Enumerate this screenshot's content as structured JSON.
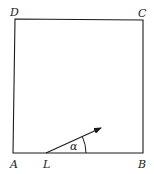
{
  "diagram": {
    "type": "square-with-vector",
    "vertices": {
      "A": {
        "label": "A",
        "x": 13,
        "y": 153
      },
      "B": {
        "label": "B",
        "x": 143,
        "y": 153
      },
      "C": {
        "label": "C",
        "x": 143,
        "y": 20
      },
      "D": {
        "label": "D",
        "x": 15,
        "y": 19
      }
    },
    "point_L": {
      "label": "L",
      "x": 46,
      "y": 153
    },
    "arrow": {
      "from": "L",
      "to_x": 102,
      "to_y": 127
    },
    "angle": {
      "label": "α",
      "between": "arrow and LB"
    },
    "colors": {
      "stroke": "#1a1a1a",
      "background": "#ffffff"
    }
  }
}
